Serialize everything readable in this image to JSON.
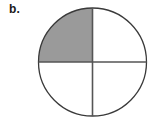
{
  "figure": {
    "label": "b.",
    "kind": "fraction-circle-diagram"
  },
  "chart_data": {
    "type": "pie",
    "title": "b.",
    "xlabel": "",
    "ylabel": "",
    "categories": [
      "upper-left",
      "upper-right",
      "lower-right",
      "lower-left"
    ],
    "values": [
      25,
      25,
      25,
      25
    ],
    "shaded": [
      "upper-left"
    ],
    "shaded_count": 1,
    "total_slices": 4,
    "fraction_shaded": "1/4",
    "legend_position": "none",
    "grid": false,
    "slices": [
      {
        "name": "upper-left",
        "value": 25,
        "start_angle": 180,
        "end_angle": 270,
        "filled": true,
        "fill": "#9a9a9a"
      },
      {
        "name": "upper-right",
        "value": 25,
        "start_angle": 270,
        "end_angle": 360,
        "filled": false,
        "fill": "#ffffff"
      },
      {
        "name": "lower-right",
        "value": 25,
        "start_angle": 0,
        "end_angle": 90,
        "filled": false,
        "fill": "#ffffff"
      },
      {
        "name": "lower-left",
        "value": 25,
        "start_angle": 90,
        "end_angle": 180,
        "filled": false,
        "fill": "#ffffff"
      }
    ]
  },
  "geometry": {
    "center_x": 92.5,
    "center_y": 62,
    "radius": 54
  },
  "colors": {
    "background": "#ffffff",
    "shaded_fill": "#9a9a9a",
    "outline": "#3a3a3a",
    "divider": "#555555",
    "label_text": "#1a1a1a"
  }
}
